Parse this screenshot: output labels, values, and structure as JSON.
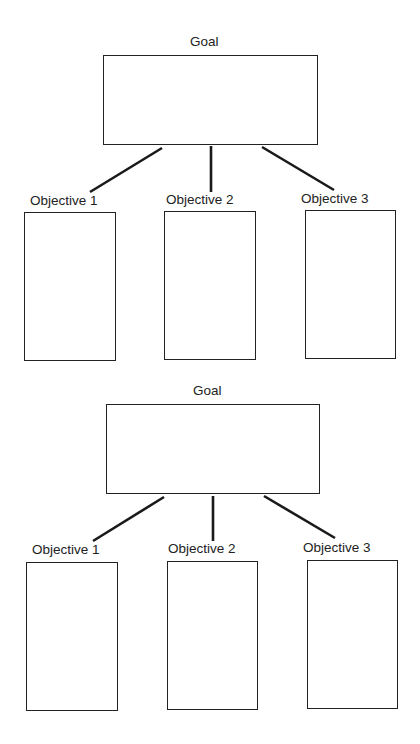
{
  "diagrams": [
    {
      "goal": {
        "label": "Goal"
      },
      "objectives": [
        {
          "label": "Objective 1"
        },
        {
          "label": "Objective 2"
        },
        {
          "label": "Objective 3"
        }
      ]
    },
    {
      "goal": {
        "label": "Goal"
      },
      "objectives": [
        {
          "label": "Objective 1"
        },
        {
          "label": "Objective 2"
        },
        {
          "label": "Objective 3"
        }
      ]
    }
  ],
  "colors": {
    "stroke": "#222222",
    "background": "#ffffff"
  }
}
